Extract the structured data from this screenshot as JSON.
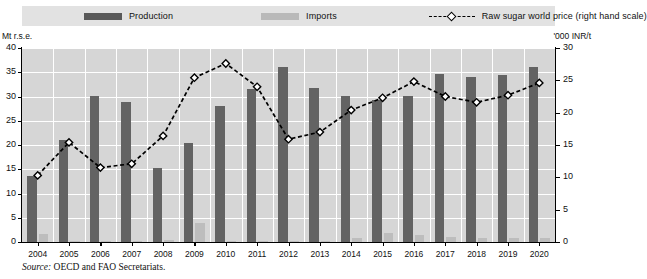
{
  "legend": {
    "production_label": "Production",
    "imports_label": "Imports",
    "price_label": "Raw sugar world price (right hand scale)",
    "production_swatch": "production-color-swatch",
    "imports_swatch": "imports-color-swatch",
    "price_swatch": "price-line-swatch"
  },
  "axes": {
    "left_unit": "Mt r.s.e.",
    "right_unit": "'000 INR/t"
  },
  "source": {
    "keyword": "Source:",
    "text": " OECD and FAO Secretariats."
  },
  "colors": {
    "production": "#636363",
    "imports": "#bdbdbd",
    "price_line": "#000000",
    "marker_fill": "#ffffff",
    "plot_background": "#d6d6d6",
    "gridline": "#ffffff",
    "legend_background": "#e2e2e2"
  },
  "chart_data": {
    "type": "bar",
    "title": "",
    "subtitle": "",
    "xlabel": "",
    "ylabel": "Mt r.s.e.",
    "y2label": "'000 INR/t",
    "ylim": [
      0,
      40
    ],
    "y2lim": [
      0,
      30
    ],
    "yticks": [
      0,
      5,
      10,
      15,
      20,
      25,
      30,
      35,
      40
    ],
    "y2ticks": [
      0,
      5,
      10,
      15,
      20,
      25,
      30
    ],
    "grid": true,
    "legend_position": "top",
    "categories": [
      "2004",
      "2005",
      "2006",
      "2007",
      "2008",
      "2009",
      "2010",
      "2011",
      "2012",
      "2013",
      "2014",
      "2015",
      "2016",
      "2017",
      "2018",
      "2019",
      "2020"
    ],
    "series": [
      {
        "name": "Production",
        "type": "bar",
        "axis": "left",
        "values": [
          13.7,
          21.0,
          30.2,
          28.8,
          15.3,
          20.5,
          28.0,
          31.5,
          36.0,
          31.7,
          30.1,
          29.3,
          30.2,
          34.7,
          34.0,
          34.5,
          36.0
        ]
      },
      {
        "name": "Imports",
        "type": "bar",
        "axis": "left",
        "values": [
          1.6,
          0.2,
          0.1,
          0.1,
          0.4,
          3.9,
          0.2,
          0.2,
          0.1,
          0.1,
          0.9,
          1.9,
          1.5,
          1.0,
          0.8,
          0.8,
          0.8
        ]
      },
      {
        "name": "Raw sugar world price (right hand scale)",
        "type": "line",
        "axis": "right",
        "marker": "diamond",
        "linestyle": "dashed",
        "values": [
          10.3,
          15.4,
          11.5,
          12.1,
          16.4,
          25.4,
          27.6,
          24.0,
          15.9,
          17.0,
          20.4,
          22.3,
          24.8,
          22.5,
          21.6,
          22.7,
          24.6
        ]
      }
    ]
  }
}
